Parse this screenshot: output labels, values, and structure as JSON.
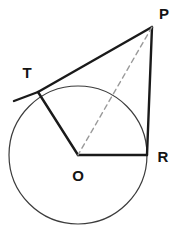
{
  "figure": {
    "type": "geometry-diagram",
    "canvas": {
      "width": 181,
      "height": 232,
      "background": "#ffffff"
    },
    "colors": {
      "stroke_solid": "#1a1a1a",
      "stroke_circle": "#3c3c3c",
      "stroke_dashed": "#9a9a9a",
      "label_text": "#141414"
    },
    "circle": {
      "name": "circle-O",
      "center_label": "O",
      "cx": 78,
      "cy": 155,
      "r": 69,
      "stroke_width": 1.2
    },
    "points": [
      {
        "id": "P",
        "label": "P",
        "x": 152,
        "y": 27,
        "label_x": 164,
        "label_y": 13,
        "position": "external-apex"
      },
      {
        "id": "T",
        "label": "T",
        "x": 38,
        "y": 92,
        "label_x": 27,
        "label_y": 72,
        "position": "tangent-point-on-circle"
      },
      {
        "id": "R",
        "label": "R",
        "x": 147,
        "y": 155,
        "label_x": 163,
        "label_y": 156,
        "position": "point-on-circle-right"
      },
      {
        "id": "O",
        "label": "O",
        "x": 78,
        "y": 155,
        "label_x": 78,
        "label_y": 175,
        "position": "circle-center"
      }
    ],
    "segments": [
      {
        "id": "PT",
        "name": "tangent-segment-pt",
        "from": "P",
        "to": "T",
        "style": "solid",
        "stroke_width": 2.4,
        "x1": 152,
        "y1": 27,
        "x2": 38,
        "y2": 92
      },
      {
        "id": "T-extension",
        "name": "tangent-line-extension",
        "from": "T",
        "to": "tangent-end",
        "style": "solid",
        "stroke_width": 2.4,
        "x1": 38,
        "y1": 92,
        "x2": 14,
        "y2": 101
      },
      {
        "id": "PR",
        "name": "segment-pr",
        "from": "P",
        "to": "R",
        "style": "solid",
        "stroke_width": 2.4,
        "x1": 152,
        "y1": 27,
        "x2": 147,
        "y2": 155
      },
      {
        "id": "OT",
        "name": "radius-ot",
        "from": "O",
        "to": "T",
        "style": "solid",
        "stroke_width": 2.4,
        "x1": 78,
        "y1": 155,
        "x2": 38,
        "y2": 92
      },
      {
        "id": "OR",
        "name": "radius-or",
        "from": "O",
        "to": "R",
        "style": "solid",
        "stroke_width": 2.4,
        "x1": 78,
        "y1": 155,
        "x2": 147,
        "y2": 155
      },
      {
        "id": "PO",
        "name": "dashed-segment-po",
        "from": "P",
        "to": "O",
        "style": "dashed",
        "stroke_width": 1.4,
        "dash_pattern": "5,4",
        "x1": 152,
        "y1": 27,
        "x2": 78,
        "y2": 155
      }
    ]
  }
}
